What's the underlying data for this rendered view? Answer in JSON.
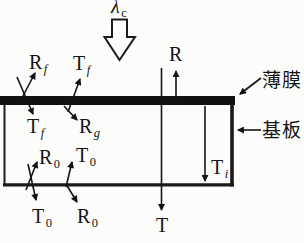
{
  "labels": {
    "lambda": {
      "base": "λ",
      "sub": "c"
    },
    "r_f": {
      "base": "R",
      "sub": "f"
    },
    "t_f_top": {
      "base": "T",
      "sub": "f"
    },
    "r_top": {
      "base": "R",
      "sub": ""
    },
    "t_f_inside": {
      "base": "T",
      "sub": "f"
    },
    "r_g": {
      "base": "R",
      "sub": "g"
    },
    "r_0_upper": {
      "base": "R",
      "sub": "0"
    },
    "t_0_upper": {
      "base": "T",
      "sub": "0"
    },
    "t_i": {
      "base": "T",
      "sub": "i"
    },
    "t_0_lower": {
      "base": "T",
      "sub": "0"
    },
    "r_0_lower": {
      "base": "R",
      "sub": "0"
    },
    "t_bottom": {
      "base": "T",
      "sub": ""
    },
    "film": {
      "text": "薄膜"
    },
    "substrate": {
      "text": "基板"
    }
  },
  "arrows": [
    {
      "name": "incident-beam",
      "type": "block-arrow",
      "direction": "down",
      "label": "λc"
    },
    {
      "name": "rf-ray",
      "direction": "up-right",
      "label": "Rf"
    },
    {
      "name": "tf-down-ray",
      "direction": "down-right",
      "label": "Tf"
    },
    {
      "name": "tf-up-ray",
      "direction": "up-right",
      "label": "Tf"
    },
    {
      "name": "rg-ray",
      "direction": "down-right",
      "label": "Rg"
    },
    {
      "name": "r-ray",
      "direction": "up",
      "label": "R"
    },
    {
      "name": "t-ray",
      "direction": "down",
      "label": "T"
    },
    {
      "name": "ti-ray",
      "direction": "down",
      "label": "Ti"
    },
    {
      "name": "r0-upper-ray",
      "direction": "up-right",
      "label": "R0"
    },
    {
      "name": "t0-lower-ray",
      "direction": "down-right",
      "label": "T0"
    },
    {
      "name": "t0-upper-ray",
      "direction": "up",
      "label": "T0"
    },
    {
      "name": "r0-lower-ray",
      "direction": "down-right",
      "label": "R0"
    },
    {
      "name": "film-pointer",
      "direction": "down-left",
      "label": "薄膜"
    },
    {
      "name": "substrate-pointer",
      "direction": "left",
      "label": "基板"
    }
  ],
  "colors": {
    "ink": "#141414",
    "paper": "#fcfcfb",
    "film_fill": "#111111"
  }
}
